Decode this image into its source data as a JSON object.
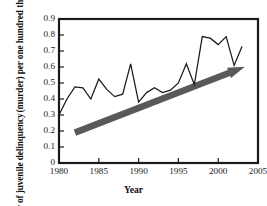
{
  "chart_data": {
    "type": "line",
    "title": "",
    "xlabel": "Year",
    "ylabel_line1": "Number of juvenile delinquency",
    "ylabel_line2": "(murder) per one hundred thousands",
    "xlim": [
      1980,
      2005
    ],
    "ylim": [
      0,
      0.9
    ],
    "grid": false,
    "legend": "none",
    "x_ticks": [
      "1980",
      "1985",
      "1990",
      "1995",
      "2000",
      "2005"
    ],
    "x_tick_values": [
      1980,
      1985,
      1990,
      1995,
      2000,
      2005
    ],
    "y_ticks": [
      "0",
      "0.1",
      "0.2",
      "0.3",
      "0.4",
      "0.5",
      "0.6",
      "0.7",
      "0.8",
      "0.9"
    ],
    "y_tick_values": [
      0,
      0.1,
      0.2,
      0.3,
      0.4,
      0.5,
      0.6,
      0.7,
      0.8,
      0.9
    ],
    "series": [
      {
        "name": "Juvenile delinquency (murder) rate",
        "color": "#1a1a1a",
        "x": [
          1980,
          1981,
          1982,
          1983,
          1984,
          1985,
          1986,
          1987,
          1988,
          1989,
          1990,
          1991,
          1992,
          1993,
          1994,
          1995,
          1996,
          1997,
          1998,
          1999,
          2000,
          2001,
          2002,
          2003
        ],
        "values": [
          0.3,
          0.4,
          0.475,
          0.47,
          0.4,
          0.525,
          0.46,
          0.415,
          0.43,
          0.62,
          0.38,
          0.44,
          0.47,
          0.44,
          0.455,
          0.5,
          0.62,
          0.49,
          0.79,
          0.78,
          0.74,
          0.79,
          0.61,
          0.73
        ]
      }
    ],
    "annotations": [
      {
        "type": "trend-arrow",
        "name": "increasing-trend-arrow",
        "color": "#59595b",
        "from_x": 1982,
        "from_y": 0.19,
        "to_x": 2003,
        "to_y": 0.595,
        "description": "thick gray upward trend arrow"
      }
    ]
  },
  "axes": {
    "x_axis_label": "Year",
    "y_axis_label_line1": "Number of juvenile delinquency",
    "y_axis_label_line2": "(murder) per one hundred thousands"
  }
}
